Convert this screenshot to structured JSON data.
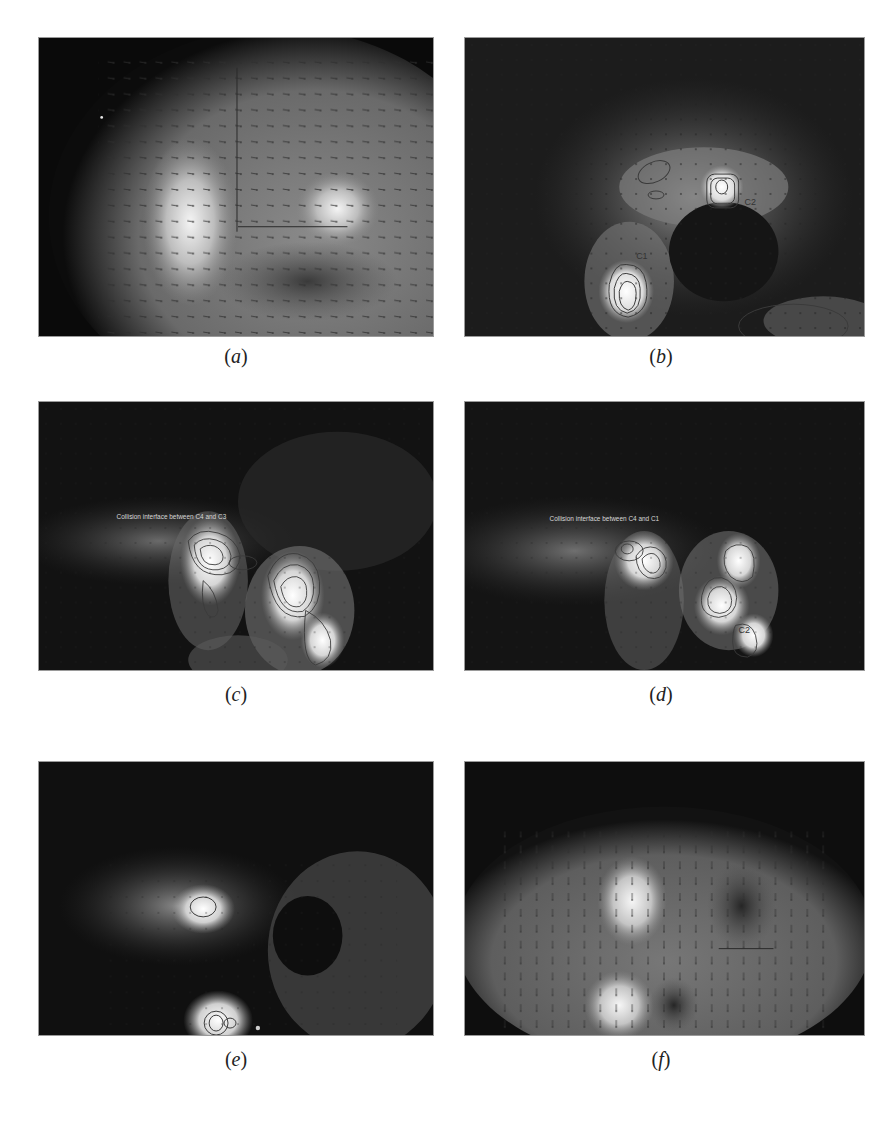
{
  "figure": {
    "panels": [
      {
        "id": "a",
        "caption_open": "(",
        "caption_letter": "a",
        "caption_close": ")",
        "annotations": [],
        "contour_labels": []
      },
      {
        "id": "b",
        "caption_open": "(",
        "caption_letter": "b",
        "caption_close": ")",
        "annotations": [],
        "contour_labels": [
          "C1",
          "C2",
          "C3"
        ]
      },
      {
        "id": "c",
        "caption_open": "(",
        "caption_letter": "c",
        "caption_close": ")",
        "annotations": [
          "Collision interface between C4 and C3"
        ],
        "contour_labels": []
      },
      {
        "id": "d",
        "caption_open": "(",
        "caption_letter": "d",
        "caption_close": ")",
        "annotations": [
          "Collision interface between C4 and C1"
        ],
        "contour_labels": [
          "C2"
        ]
      },
      {
        "id": "e",
        "caption_open": "(",
        "caption_letter": "e",
        "caption_close": ")",
        "annotations": [],
        "contour_labels": []
      },
      {
        "id": "f",
        "caption_open": "(",
        "caption_letter": "f",
        "caption_close": ")",
        "annotations": [],
        "contour_labels": []
      }
    ]
  },
  "colors": {
    "background": "#ffffff",
    "panel_dark": "#0a0a0a",
    "bright_region": "#f2f2f2",
    "contour_line": "#3a3a3a",
    "arrow": "#333333"
  }
}
